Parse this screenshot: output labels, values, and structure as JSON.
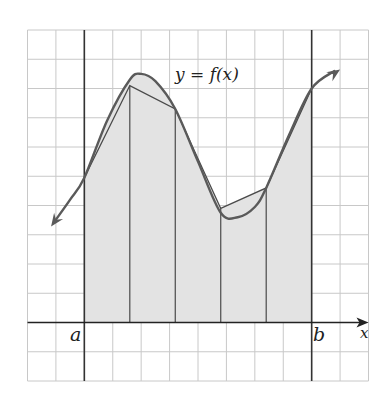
{
  "figure": {
    "curve_label": "y = f(x)",
    "x_axis_label": "x",
    "left_bound_label": "a",
    "right_bound_label": "b",
    "colors": {
      "grid": "#c8c8c8",
      "axis": "#222222",
      "bound_lines": "#333333",
      "curve": "#5a5a5a",
      "trapezoid_edges": "#4a4a4a",
      "fill": "#e3e3e3",
      "background": "#ffffff"
    }
  },
  "chart_data": {
    "type": "area",
    "title": "",
    "curve_label": "y = f(x)",
    "xlabel": "x",
    "ylabel": "",
    "grid": true,
    "grid_units": {
      "x_range": [
        -2,
        10
      ],
      "y_range": [
        -2,
        10
      ]
    },
    "bounds": {
      "a": 0,
      "b": 8
    },
    "subintervals": 5,
    "partition_x": [
      0,
      1.6,
      3.2,
      4.8,
      6.4,
      8.0
    ],
    "trapezoid_heights": [
      4.95,
      8.1,
      7.3,
      3.9,
      4.6,
      8.0
    ],
    "curve_points": [
      {
        "x": -1.05,
        "y": 3.45
      },
      {
        "x": -0.5,
        "y": 4.2
      },
      {
        "x": 0.0,
        "y": 4.95
      },
      {
        "x": 0.8,
        "y": 6.9
      },
      {
        "x": 1.6,
        "y": 8.3
      },
      {
        "x": 2.0,
        "y": 8.5
      },
      {
        "x": 2.5,
        "y": 8.25
      },
      {
        "x": 3.2,
        "y": 7.3
      },
      {
        "x": 4.0,
        "y": 5.5
      },
      {
        "x": 4.8,
        "y": 3.75
      },
      {
        "x": 5.4,
        "y": 3.6
      },
      {
        "x": 6.0,
        "y": 3.95
      },
      {
        "x": 6.4,
        "y": 4.6
      },
      {
        "x": 7.2,
        "y": 6.4
      },
      {
        "x": 8.0,
        "y": 8.0
      },
      {
        "x": 8.8,
        "y": 8.6
      }
    ],
    "shaded_region": "trapezoids between x = a and x = b"
  }
}
